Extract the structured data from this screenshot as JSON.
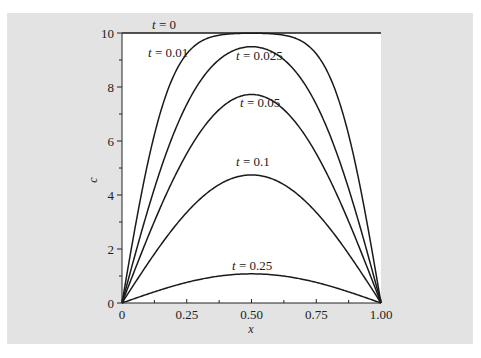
{
  "chart_data": {
    "type": "line",
    "title": "",
    "xlabel": "x",
    "ylabel": "c",
    "xlim": [
      0,
      1
    ],
    "ylim": [
      0,
      10
    ],
    "grid": false,
    "legend": "inline curve labels",
    "x_ticks": [
      "0",
      "0.25",
      "0.50",
      "0.75",
      "1.00"
    ],
    "y_ticks": [
      "0",
      "2",
      "4",
      "6",
      "8",
      "10"
    ],
    "x": [
      0,
      0.125,
      0.25,
      0.375,
      0.5,
      0.625,
      0.75,
      0.875,
      1.0
    ],
    "series": [
      {
        "name": "t = 0",
        "label": "t = 0",
        "t": 0,
        "values": [
          10,
          10,
          10,
          10,
          10,
          10,
          10,
          10,
          10
        ]
      },
      {
        "name": "t = 0.01",
        "label": "t = 0.01",
        "t": 0.01,
        "values": [
          0,
          6.2,
          9.2,
          9.9,
          10.0,
          9.9,
          9.2,
          6.2,
          0
        ]
      },
      {
        "name": "t = 0.025",
        "label": "t = 0.025",
        "t": 0.025,
        "values": [
          0,
          4.2,
          7.1,
          8.8,
          9.5,
          8.8,
          7.1,
          4.2,
          0
        ]
      },
      {
        "name": "t = 0.05",
        "label": "t = 0.05",
        "t": 0.05,
        "values": [
          0,
          3.0,
          5.5,
          7.1,
          7.7,
          7.1,
          5.5,
          3.0,
          0
        ]
      },
      {
        "name": "t = 0.1",
        "label": "t = 0.1",
        "t": 0.1,
        "values": [
          0,
          1.8,
          3.4,
          4.4,
          4.8,
          4.4,
          3.4,
          1.8,
          0
        ]
      },
      {
        "name": "t = 0.25",
        "label": "t = 0.25",
        "t": 0.25,
        "values": [
          0,
          0.41,
          0.76,
          0.99,
          1.08,
          0.99,
          0.76,
          0.41,
          0
        ]
      }
    ],
    "annotations": [
      {
        "text": "t = 0",
        "x": 0.06,
        "y": 10.3
      },
      {
        "text": "t = 0.01",
        "x": 0.06,
        "y": 9.0
      },
      {
        "text": "t = 0.025",
        "x": 0.5,
        "y": 9.0
      },
      {
        "text": "t = 0.05",
        "x": 0.5,
        "y": 7.3
      },
      {
        "text": "t = 0.1",
        "x": 0.5,
        "y": 5.0
      },
      {
        "text": "t = 0.25",
        "x": 0.5,
        "y": 1.3
      }
    ]
  },
  "colors": {
    "panel": "#e3e3e3",
    "plot_bg": "#ffffff",
    "line": "#1a1a1a"
  }
}
